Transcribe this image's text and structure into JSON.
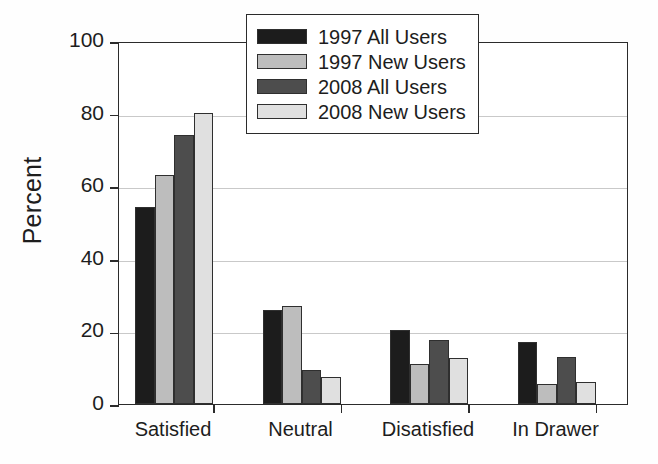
{
  "chart_data": {
    "type": "bar",
    "title": "",
    "subtitle": "",
    "xlabel": "",
    "ylabel": "Percent",
    "categories": [
      "Satisfied",
      "Neutral",
      "Disatisfied",
      "In Drawer"
    ],
    "series": [
      {
        "name": "1997 All Users",
        "color": "#1c1c1c",
        "values": [
          54.2,
          26.0,
          20.5,
          17.0
        ]
      },
      {
        "name": "1997 New Users",
        "color": "#bdbdbd",
        "values": [
          63.0,
          27.0,
          11.0,
          5.5
        ]
      },
      {
        "name": "2008 All Users",
        "color": "#4d4d4d",
        "values": [
          74.0,
          9.5,
          17.5,
          13.0
        ]
      },
      {
        "name": "2008 New Users",
        "color": "#e0e0e0",
        "values": [
          80.2,
          7.5,
          12.8,
          6.0
        ]
      }
    ],
    "ylim": [
      0,
      100
    ],
    "yticks": [
      0,
      20,
      40,
      60,
      80,
      100
    ],
    "yticklabels": [
      "0",
      "20",
      "40",
      "60",
      "80",
      "100"
    ],
    "grid": true,
    "grid_axis": "y",
    "legend_position": "top-right",
    "bar_edge_color": "#2f2f2f",
    "axis_color": "#2b2b2b",
    "gridline_color": "#c9c9c9",
    "background_color": "#ffffff"
  },
  "legend": {
    "entries": [
      {
        "label": "1997 All Users",
        "swatch": "#1c1c1c"
      },
      {
        "label": "1997 New Users",
        "swatch": "#bdbdbd"
      },
      {
        "label": "2008 All Users",
        "swatch": "#4d4d4d"
      },
      {
        "label": "2008 New Users",
        "swatch": "#e0e0e0"
      }
    ]
  }
}
